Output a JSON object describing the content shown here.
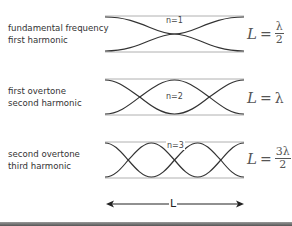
{
  "diagram": {
    "rows": [
      {
        "label_lines": [
          "fundamental frequency",
          "first harmonic"
        ],
        "n_label": "n=1",
        "formula": {
          "lhs": "L",
          "eq": "=",
          "numerator": "λ",
          "denominator": "2",
          "whole": ""
        }
      },
      {
        "label_lines": [
          "first overtone",
          "second harmonic"
        ],
        "n_label": "n=2",
        "formula": {
          "lhs": "L",
          "eq": "=",
          "numerator": "",
          "denominator": "",
          "whole": "λ"
        }
      },
      {
        "label_lines": [
          "second overtone",
          "third harmonic"
        ],
        "n_label": "n=3",
        "formula": {
          "lhs": "L",
          "eq": "=",
          "numerator": "3λ",
          "denominator": "2",
          "whole": ""
        }
      }
    ],
    "length_arrow": {
      "label": "L"
    },
    "colors": {
      "wave": "#333333",
      "box_line": "#aaaaaa",
      "text": "#333333"
    }
  }
}
